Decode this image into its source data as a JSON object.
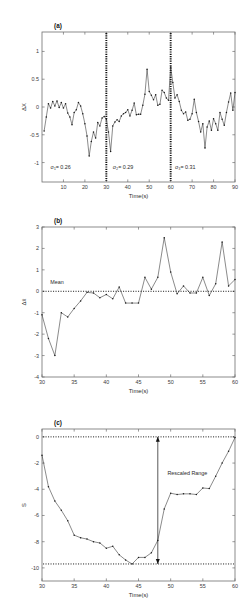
{
  "figure": {
    "panels": [
      {
        "id": "a",
        "label": "(a)",
        "xlabel": "Time(s)",
        "ylabel": "ΔX"
      },
      {
        "id": "b",
        "label": "(b)",
        "xlabel": "Time(s)",
        "ylabel": "Δx̄"
      },
      {
        "id": "c",
        "label": "(c)",
        "xlabel": "Time(s)",
        "ylabel": "S"
      }
    ]
  },
  "chart_data": [
    {
      "type": "line",
      "panel": "a",
      "title": "(a)",
      "xlabel": "Time(s)",
      "ylabel": "ΔX",
      "xlim": [
        0,
        90
      ],
      "ylim": [
        -1.35,
        1.35
      ],
      "xticks": [
        10,
        20,
        30,
        40,
        50,
        60,
        70,
        80,
        90
      ],
      "yticks": [
        1,
        0.5,
        0,
        -0.5,
        -1
      ],
      "ytick_labels": [
        "1",
        "0.5",
        "0",
        "-0.5",
        "-1"
      ],
      "grid": false,
      "legend": "none",
      "markers": true,
      "dividers": [
        30,
        60
      ],
      "annotations": [
        {
          "text": "σ₁= 0.26",
          "x": 4,
          "y": -1.12
        },
        {
          "text": "σ₂= 0.29",
          "x": 33,
          "y": -1.12
        },
        {
          "text": "σ₃= 0.31",
          "x": 62,
          "y": -1.12
        }
      ],
      "x": [
        1,
        2,
        3,
        4,
        5,
        6,
        7,
        8,
        9,
        10,
        11,
        12,
        13,
        14,
        15,
        16,
        17,
        18,
        19,
        20,
        21,
        22,
        23,
        24,
        25,
        26,
        27,
        28,
        29,
        30,
        31,
        32,
        33,
        34,
        35,
        36,
        37,
        38,
        39,
        40,
        41,
        42,
        43,
        44,
        45,
        46,
        47,
        48,
        49,
        50,
        51,
        52,
        53,
        54,
        55,
        56,
        57,
        58,
        59,
        60,
        61,
        62,
        63,
        64,
        65,
        66,
        67,
        68,
        69,
        70,
        71,
        72,
        73,
        74,
        75,
        76,
        77,
        78,
        79,
        80,
        81,
        82,
        83,
        84,
        85,
        86,
        87,
        88,
        89,
        90
      ],
      "values": [
        -0.43,
        -0.18,
        0.06,
        -0.02,
        0.1,
        0.02,
        0.11,
        -0.01,
        0.08,
        -0.02,
        0.06,
        -0.11,
        -0.18,
        -0.32,
        -0.1,
        -0.05,
        0.08,
        0.02,
        -0.12,
        -0.3,
        -0.52,
        -0.88,
        -0.62,
        -0.45,
        -0.56,
        -0.28,
        -0.34,
        -0.2,
        -0.17,
        -0.22,
        -0.45,
        -0.8,
        -0.34,
        -0.27,
        -0.23,
        -0.26,
        -0.16,
        -0.12,
        -0.1,
        -0.05,
        -0.16,
        -0.06,
        0.07,
        -0.14,
        -0.13,
        -0.13,
        0.03,
        0.23,
        0.68,
        0.28,
        0.21,
        0.13,
        0.22,
        0.03,
        0.05,
        0.3,
        0.26,
        0.16,
        0.12,
        0.72,
        0.44,
        0.16,
        0.22,
        0.1,
        -0.06,
        -0.12,
        -0.09,
        -0.24,
        -0.22,
        -0.12,
        0.14,
        -0.1,
        -0.26,
        -0.45,
        -0.3,
        -0.74,
        -0.36,
        -0.25,
        -0.42,
        -0.21,
        -0.3,
        -0.42,
        -0.1,
        -0.22,
        -0.33,
        -0.1,
        0.09,
        0.25,
        -0.06,
        0.26
      ]
    },
    {
      "type": "line",
      "panel": "b",
      "title": "(b)",
      "xlabel": "Time(s)",
      "ylabel": "Δx̄",
      "xlim": [
        30,
        60
      ],
      "ylim": [
        -4,
        3
      ],
      "xticks": [
        30,
        35,
        40,
        45,
        50,
        55,
        60
      ],
      "yticks": [
        3,
        2,
        1,
        0,
        -1,
        -2,
        -3,
        -4
      ],
      "grid": false,
      "legend": "none",
      "markers": true,
      "reference_line": {
        "y": 0,
        "label": "Mean",
        "style": "dotted"
      },
      "annotations": [
        {
          "text": "Mean",
          "x": 31.3,
          "y": 0.33
        }
      ],
      "x": [
        30,
        31,
        32,
        33,
        34,
        35,
        36,
        37,
        38,
        39,
        40,
        41,
        42,
        43,
        44,
        45,
        46,
        47,
        48,
        49,
        50,
        51,
        52,
        53,
        54,
        55,
        56,
        57,
        58,
        59,
        60
      ],
      "values": [
        -1.1,
        -2.2,
        -3.0,
        -1.0,
        -1.2,
        -0.8,
        -0.45,
        -0.05,
        -0.08,
        -0.3,
        -0.15,
        -0.35,
        0.2,
        -0.55,
        -0.55,
        -0.55,
        0.65,
        0.1,
        0.65,
        2.5,
        0.9,
        -0.12,
        0.25,
        -0.08,
        -0.08,
        0.65,
        -0.2,
        0.35,
        2.3,
        0.25,
        0.55
      ]
    },
    {
      "type": "line",
      "panel": "c",
      "title": "(c)",
      "xlabel": "Time(s)",
      "ylabel": "S",
      "xlim": [
        30,
        60
      ],
      "ylim": [
        -11,
        0.6
      ],
      "xticks": [
        30,
        35,
        40,
        45,
        50,
        55,
        60
      ],
      "yticks": [
        0,
        -2,
        -4,
        -6,
        -8,
        -10
      ],
      "grid": false,
      "legend": "none",
      "markers": true,
      "reference_lines": [
        {
          "y": 0,
          "style": "dotted"
        },
        {
          "y": -9.7,
          "style": "dotted"
        }
      ],
      "annotations": [
        {
          "text": "Rescaled Range",
          "x": 49.5,
          "y": -2.9
        }
      ],
      "range_arrow": {
        "x": 48,
        "y_top": 0,
        "y_bottom": -9.7
      },
      "x": [
        30,
        31,
        32,
        33,
        34,
        35,
        36,
        37,
        38,
        39,
        40,
        41,
        42,
        43,
        44,
        45,
        46,
        47,
        48,
        49,
        50,
        51,
        52,
        53,
        54,
        55,
        56,
        57,
        58,
        59,
        60
      ],
      "values": [
        -1.4,
        -3.8,
        -4.9,
        -5.6,
        -6.4,
        -7.5,
        -7.7,
        -7.8,
        -8.0,
        -8.1,
        -8.5,
        -8.35,
        -9.0,
        -9.4,
        -9.7,
        -9.2,
        -9.2,
        -8.85,
        -7.9,
        -5.5,
        -4.3,
        -4.4,
        -4.35,
        -4.35,
        -4.4,
        -3.9,
        -3.95,
        -3.0,
        -2.0,
        -1.1,
        -0.05
      ]
    }
  ]
}
